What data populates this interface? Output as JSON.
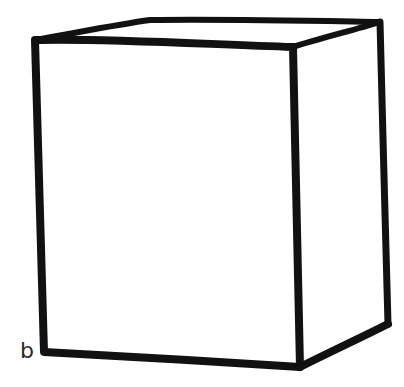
{
  "figure": {
    "label": "b",
    "stroke_color": "#111111",
    "background_color": "#ffffff",
    "stroke_width": 7
  },
  "shape": {
    "type": "cuboid",
    "vertices": {
      "front_top_left": [
        35,
        40
      ],
      "front_top_right": [
        293,
        47
      ],
      "front_bottom_left": [
        44,
        352
      ],
      "front_bottom_right": [
        300,
        367
      ],
      "back_top_left": [
        150,
        20
      ],
      "back_top_right": [
        380,
        22
      ],
      "back_bottom_right": [
        388,
        324
      ]
    }
  }
}
